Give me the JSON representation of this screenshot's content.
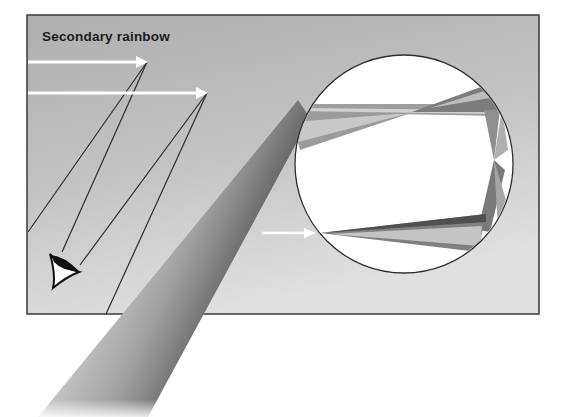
{
  "figure": {
    "title": "Secondary rainbow",
    "colors": {
      "background": "#ffffff",
      "panel": "#b4b4b4",
      "panel_light": "#d6d6d6",
      "frame": "#3a3a3a",
      "ray": "#ffffff",
      "sight_line": "#2a2a2a",
      "droplet_fill": "#ffffff",
      "droplet_outline": "#2e2e2e"
    },
    "elements": {
      "incoming_rays": [
        {
          "y": 62,
          "x1": 28,
          "x2": 147
        },
        {
          "y": 93,
          "x1": 28,
          "x2": 207
        },
        {
          "y": 233,
          "x1": 262,
          "x2": 315
        }
      ],
      "droplet": {
        "cx": 404,
        "cy": 164,
        "r": 109
      },
      "observer": "eye-icon",
      "beam": "refracted light beam (spectrum bands)"
    }
  }
}
